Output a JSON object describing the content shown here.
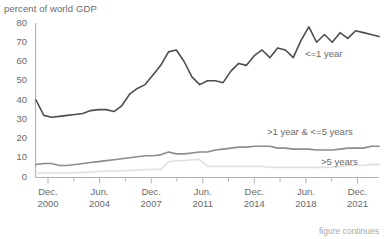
{
  "figure": {
    "axis_title": "percent of world GDP",
    "footnote": "figure continues",
    "colors": {
      "series_short": "#4d4d4f",
      "series_mid": "#8c8c8e",
      "series_long": "#e2e2e2",
      "axis": "#b3b3b5",
      "text": "#6a6a6c",
      "footnote": "#a8a8aa",
      "background": "#ffffff"
    }
  },
  "y_axis": {
    "label": "percent of world GDP",
    "ticks": [
      "80",
      "70",
      "60",
      "50",
      "40",
      "30",
      "20",
      "10",
      "0"
    ],
    "min": 0,
    "max": 80
  },
  "x_axis": {
    "ticks": [
      {
        "line1": "Dec.",
        "line2": "2000"
      },
      {
        "line1": "Jun.",
        "line2": "2004"
      },
      {
        "line1": "Dec.",
        "line2": "2007"
      },
      {
        "line1": "Jun.",
        "line2": "2011"
      },
      {
        "line1": "Dec.",
        "line2": "2014"
      },
      {
        "line1": "Jun.",
        "line2": "2018"
      },
      {
        "line1": "Dec.",
        "line2": "2021"
      }
    ]
  },
  "series_labels": {
    "short": "<=1 year",
    "mid": ">1 year & <=5 years",
    "long": ">5 years"
  },
  "chart_data": {
    "type": "line",
    "title": "",
    "subtitle": "",
    "xlabel": "",
    "ylabel": "percent of world GDP",
    "ylim": [
      0,
      80
    ],
    "grid": false,
    "legend_position": "inline-right",
    "x_tick_labels": [
      "Dec. 2000",
      "Jun. 2004",
      "Dec. 2007",
      "Jun. 2011",
      "Dec. 2014",
      "Jun. 2018",
      "Dec. 2021"
    ],
    "x": [
      "Dec. 2000",
      "Jun. 2001",
      "Dec. 2001",
      "Jun. 2002",
      "Dec. 2002",
      "Jun. 2003",
      "Dec. 2003",
      "Jun. 2004",
      "Dec. 2004",
      "Jun. 2005",
      "Dec. 2005",
      "Jun. 2006",
      "Dec. 2006",
      "Jun. 2007",
      "Dec. 2007",
      "Jun. 2008",
      "Dec. 2008",
      "Jun. 2009",
      "Dec. 2009",
      "Jun. 2010",
      "Dec. 2010",
      "Jun. 2011",
      "Dec. 2011",
      "Jun. 2012",
      "Dec. 2012",
      "Jun. 2013",
      "Dec. 2013",
      "Jun. 2014",
      "Dec. 2014",
      "Jun. 2015",
      "Dec. 2015",
      "Jun. 2016",
      "Dec. 2016",
      "Jun. 2017",
      "Dec. 2017",
      "Jun. 2018",
      "Dec. 2018",
      "Jun. 2019",
      "Dec. 2019",
      "Jun. 2020",
      "Dec. 2020",
      "Jun. 2021",
      "Dec. 2021",
      "Jun. 2022",
      "Dec. 2022"
    ],
    "series": [
      {
        "name": "<=1 year",
        "color": "#4d4d4f",
        "values": [
          40,
          32,
          31,
          31.5,
          32,
          32.5,
          33,
          34.5,
          35,
          35,
          34,
          37,
          43,
          46,
          48,
          53,
          58,
          65,
          66,
          60,
          52,
          48,
          50,
          50,
          49,
          55,
          59,
          58,
          63,
          66,
          62,
          67,
          66,
          62,
          71,
          78,
          70,
          74,
          70,
          75,
          72,
          76,
          75,
          74,
          73
        ]
      },
      {
        "name": ">1 year & <=5 years",
        "color": "#8c8c8e",
        "values": [
          6.5,
          7,
          7,
          6,
          6,
          6.5,
          7,
          7.5,
          8,
          8.5,
          9,
          9.5,
          10,
          10.5,
          11,
          11,
          11.5,
          13,
          12,
          12,
          12.5,
          13,
          13,
          14,
          14.5,
          15,
          15.5,
          15.5,
          16,
          16,
          16,
          15,
          15,
          14.5,
          14.5,
          14.5,
          14,
          14,
          14,
          14.5,
          15,
          15,
          15,
          16,
          16
        ]
      },
      {
        "name": ">5 years",
        "color": "#e2e2e2",
        "values": [
          2,
          2,
          2,
          2,
          2,
          2.2,
          2.4,
          2.6,
          2.8,
          3,
          3,
          3.2,
          3.4,
          3.6,
          3.8,
          4,
          4,
          8,
          8.5,
          8.5,
          9,
          9,
          5.5,
          5.5,
          5.5,
          5.5,
          5.5,
          5.5,
          5.5,
          5.5,
          5,
          5,
          5,
          5,
          5,
          5,
          5,
          5,
          5,
          5.5,
          6,
          6,
          6,
          6.5,
          6.5
        ]
      }
    ]
  }
}
